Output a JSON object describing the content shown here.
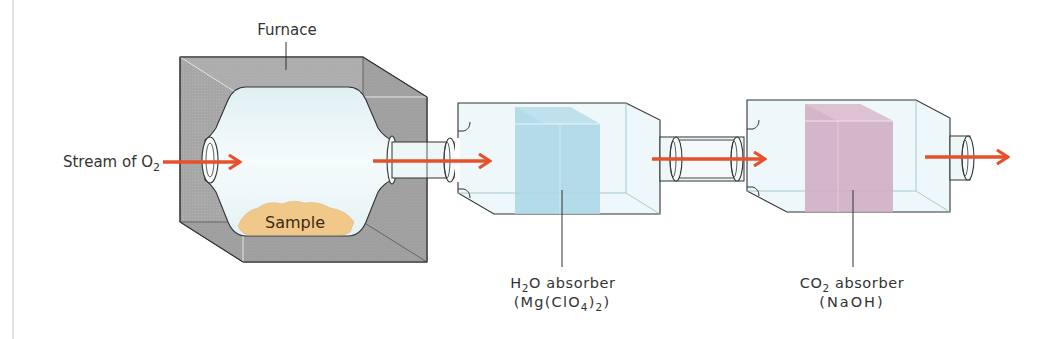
{
  "diagram": {
    "colors": {
      "arrow": "#e8502a",
      "furnace": "#a9a9a9",
      "furnace_dark": "#8f8f8f",
      "glass": "#e8f5f7",
      "h2o_absorber": "#a8d6e6",
      "co2_absorber": "#cfaec3",
      "sample": "#f0c98a"
    },
    "labels": {
      "furnace": "Furnace",
      "stream_prefix": "Stream of O",
      "stream_subscript": "2",
      "sample": "Sample",
      "h2o_line1_a": "H",
      "h2o_line1_sub": "2",
      "h2o_line1_b": "O absorber",
      "h2o_line2_a": "(Mg(ClO",
      "h2o_line2_sub1": "4",
      "h2o_line2_b": ")",
      "h2o_line2_sub2": "2",
      "h2o_line2_c": ")",
      "co2_line1_a": "CO",
      "co2_line1_sub": "2",
      "co2_line1_b": " absorber",
      "co2_line2": "(NaOH)"
    },
    "components": [
      {
        "name": "furnace",
        "label": "Furnace"
      },
      {
        "name": "combustion-tube",
        "contains": "Sample"
      },
      {
        "name": "h2o-absorber",
        "label": "H2O absorber (Mg(ClO4)2)"
      },
      {
        "name": "co2-absorber",
        "label": "CO2 absorber (NaOH)"
      }
    ],
    "flow": [
      "Stream of O2",
      "Furnace",
      "H2O absorber",
      "CO2 absorber",
      "exit"
    ]
  }
}
